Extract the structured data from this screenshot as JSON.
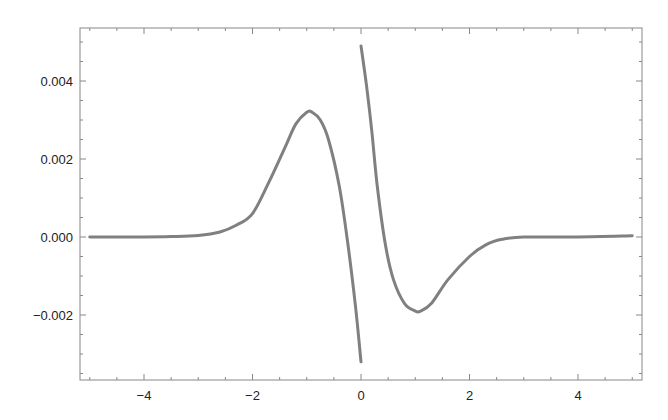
{
  "chart_data": {
    "type": "line",
    "title": "",
    "xlabel": "",
    "ylabel": "",
    "xlim": [
      -5.2,
      5.2
    ],
    "ylim": [
      -0.0037,
      0.0053
    ],
    "grid": false,
    "legend": null,
    "x_ticks": [
      {
        "value": -4,
        "label": "-4"
      },
      {
        "value": -2,
        "label": "-2"
      },
      {
        "value": 0,
        "label": "0"
      },
      {
        "value": 2,
        "label": "2"
      },
      {
        "value": 4,
        "label": "4"
      }
    ],
    "x_minor_step": 0.5,
    "y_ticks": [
      {
        "value": 0.004,
        "label": "0.004"
      },
      {
        "value": 0.002,
        "label": "0.002"
      },
      {
        "value": 0.0,
        "label": "0.000"
      },
      {
        "value": -0.002,
        "label": "-0.002"
      }
    ],
    "y_minor_step": 0.0005,
    "line_color": "#808080",
    "series": [
      {
        "name": "left-branch (x<0)",
        "x": [
          -5,
          -4,
          -3.5,
          -3,
          -2.6,
          -2.3,
          -2.0,
          -1.7,
          -1.4,
          -1.2,
          -1.0,
          -0.9,
          -0.75,
          -0.6,
          -0.4,
          -0.24,
          -0.1,
          0
        ],
        "values": [
          0,
          0,
          1e-05,
          4e-05,
          0.00013,
          0.0003,
          0.0006,
          0.0014,
          0.0023,
          0.0029,
          0.0032,
          0.0032,
          0.003,
          0.0025,
          0.0013,
          -0.0002,
          -0.0018,
          -0.0032
        ]
      },
      {
        "name": "right-branch (x>0)",
        "x": [
          0,
          0.1,
          0.2,
          0.3,
          0.45,
          0.6,
          0.8,
          1.0,
          1.1,
          1.3,
          1.6,
          2.0,
          2.3,
          2.6,
          3,
          4,
          5
        ],
        "values": [
          0.0049,
          0.0039,
          0.0027,
          0.0013,
          -0.0002,
          -0.0011,
          -0.0017,
          -0.0019,
          -0.0019,
          -0.0017,
          -0.0011,
          -0.0005,
          -0.0002,
          -6e-05,
          0,
          0,
          3e-05
        ]
      }
    ]
  }
}
